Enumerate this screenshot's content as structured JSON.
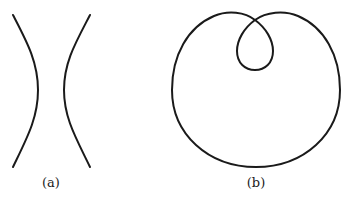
{
  "figure": {
    "panels": [
      {
        "id": "a",
        "label": "(a)",
        "shape": "hyperbola",
        "description": "Two branches of a hyperbola opening left and right"
      },
      {
        "id": "b",
        "label": "(b)",
        "shape": "limacon-with-inner-loop",
        "description": "Limaçon curve with a small inner loop at the top"
      }
    ],
    "stroke_color": "#1a1a1a",
    "background": "#ffffff"
  }
}
